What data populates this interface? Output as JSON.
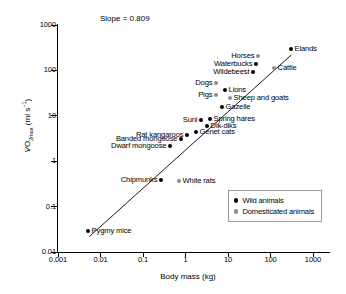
{
  "chart_data": {
    "type": "scatter",
    "title": "",
    "xlabel": "Body mass (kg)",
    "ylabel": "VO2max (ml s-1)",
    "ylabel_parts": {
      "v": "V",
      "o": "O",
      "sub": "2max",
      "units": "(ml s",
      "sup": "-1",
      "close": ")"
    },
    "xscale": "log",
    "yscale": "log",
    "xlim": [
      0.001,
      1000
    ],
    "ylim": [
      0.01,
      1000
    ],
    "xticks": [
      "0.001",
      "0.01",
      "0.1",
      "1",
      "10",
      "100",
      "1000"
    ],
    "yticks": [
      "0.01",
      "0.1",
      "1",
      "10",
      "100",
      "1000"
    ],
    "grid": false,
    "annotation": "Slope = 0.809",
    "slope": 0.809,
    "regression_line": {
      "x0": 0.0055,
      "y0": 0.022,
      "x1": 310,
      "y1": 220
    },
    "legend": {
      "position": "lower-right",
      "entries": [
        {
          "label": "Wild animals",
          "marker": "filled-circle",
          "color": "#000000"
        },
        {
          "label": "Domesticated animals",
          "marker": "filled-circle",
          "color": "#8c8c8c"
        }
      ]
    },
    "points": [
      {
        "label": "Pygmy mice",
        "x": 0.0075,
        "y": 0.028,
        "group": "wild",
        "px": 88,
        "py": 231,
        "label_side": "right"
      },
      {
        "label": "Chipmunks",
        "x": 0.095,
        "y": 0.4,
        "group": "wild",
        "px": 161,
        "py": 180,
        "label_side": "left"
      },
      {
        "label": "White rats",
        "x": 0.22,
        "y": 0.4,
        "group": "dom",
        "px": 179,
        "py": 181,
        "label_side": "right"
      },
      {
        "label": "Dwarf mongoose",
        "x": 0.42,
        "y": 1.55,
        "group": "wild",
        "px": 170,
        "py": 146,
        "label_side": "left"
      },
      {
        "label": "Banded mongoose",
        "x": 0.8,
        "y": 2.3,
        "group": "wild",
        "px": 181,
        "py": 139,
        "label_side": "left"
      },
      {
        "label": "Rat kangaroos",
        "x": 1.05,
        "y": 2.9,
        "group": "wild",
        "px": 187,
        "py": 135,
        "label_side": "left"
      },
      {
        "label": "Genet cats",
        "x": 1.7,
        "y": 3.4,
        "group": "wild",
        "px": 196,
        "py": 132,
        "label_side": "right"
      },
      {
        "label": "Dik-diks",
        "x": 3.6,
        "y": 5.4,
        "group": "wild",
        "px": 207,
        "py": 126,
        "label_side": "right"
      },
      {
        "label": "Suni",
        "x": 3.0,
        "y": 7.0,
        "group": "wild",
        "px": 201,
        "py": 120,
        "label_side": "left"
      },
      {
        "label": "Spring hares",
        "x": 4.2,
        "y": 8.0,
        "group": "wild",
        "px": 210,
        "py": 119,
        "label_side": "right"
      },
      {
        "label": "Gazelle",
        "x": 9.5,
        "y": 13.5,
        "group": "wild",
        "px": 222,
        "py": 107,
        "label_side": "right"
      },
      {
        "label": "Sheep and goats",
        "x": 17,
        "y": 21,
        "group": "dom",
        "px": 230,
        "py": 98,
        "label_side": "right"
      },
      {
        "label": "Pigs",
        "x": 13,
        "y": 26,
        "group": "dom",
        "px": 216,
        "py": 95,
        "label_side": "left"
      },
      {
        "label": "Lions",
        "x": 22,
        "y": 31,
        "group": "wild",
        "px": 225,
        "py": 90,
        "label_side": "right"
      },
      {
        "label": "Dogs",
        "x": 17,
        "y": 45,
        "group": "dom",
        "px": 216,
        "py": 83,
        "label_side": "left"
      },
      {
        "label": "Wildebeest",
        "x": 86,
        "y": 88,
        "group": "wild",
        "px": 253,
        "py": 72,
        "label_side": "left"
      },
      {
        "label": "Waterbucks",
        "x": 95,
        "y": 120,
        "group": "wild",
        "px": 256,
        "py": 64,
        "label_side": "left"
      },
      {
        "label": "Cattle",
        "x": 150,
        "y": 105,
        "group": "dom",
        "px": 274,
        "py": 68,
        "label_side": "right"
      },
      {
        "label": "Horses",
        "x": 130,
        "y": 165,
        "group": "dom",
        "px": 258,
        "py": 56,
        "label_side": "left"
      },
      {
        "label": "Elands",
        "x": 290,
        "y": 215,
        "group": "wild",
        "px": 291,
        "py": 49,
        "label_side": "right"
      }
    ]
  }
}
